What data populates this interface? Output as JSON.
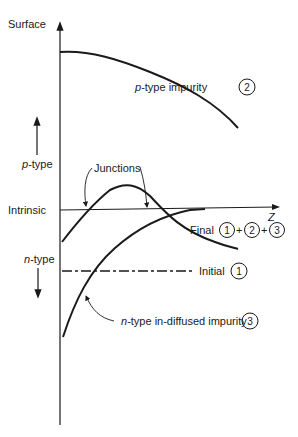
{
  "diagram": {
    "axis": {
      "vertical_label_top": "Surface",
      "horizontal_label": "Z",
      "p_type_label_prefix": "p",
      "p_type_label_suffix": "-type",
      "intrinsic_label": "Intrinsic",
      "n_type_label_prefix": "n",
      "n_type_label_suffix": "-type"
    },
    "annotations": {
      "junctions": "Junctions",
      "p_impurity_prefix": "p",
      "p_impurity_suffix": "-type impurity",
      "p_impurity_num": "2",
      "final_label": "Final",
      "final_nums": [
        "1",
        "2",
        "3"
      ],
      "final_plus": "+",
      "initial_label": "Initial",
      "initial_num": "1",
      "n_impurity_prefix": "n",
      "n_impurity_suffix": "-type in-diffused impurity",
      "n_impurity_num": "3"
    },
    "colors": {
      "ink": "#1a1a1a",
      "background": "#ffffff"
    }
  }
}
